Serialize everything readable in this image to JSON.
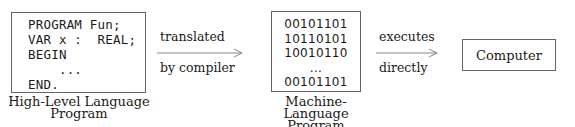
{
  "diagram": {
    "high_level": {
      "code_lines": [
        "PROGRAM Fun;",
        "VAR x :  REAL;",
        "BEGIN",
        "    ...",
        "END."
      ],
      "caption_lines": [
        "High-Level Language",
        "Program"
      ]
    },
    "arrow1": {
      "label_top": "translated",
      "label_bottom": "by compiler"
    },
    "machine": {
      "code_lines": [
        "00101101",
        "10110101",
        "10010110",
        "...",
        "00101101"
      ],
      "caption_lines": [
        "Machine-Language",
        "Program"
      ]
    },
    "arrow2": {
      "label_top": "executes",
      "label_bottom": "directly"
    },
    "computer": {
      "label": "Computer"
    },
    "colors": {
      "border": "#666666",
      "arrow": "#888888",
      "text": "#1a1a1a"
    }
  }
}
